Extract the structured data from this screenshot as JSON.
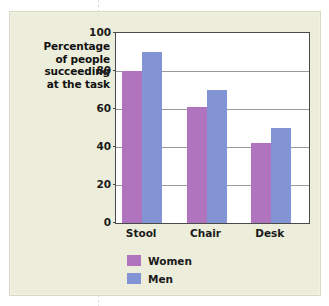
{
  "chart_data": {
    "type": "bar",
    "title": "",
    "xlabel": "",
    "ylabel": "Percentage of people succeeding at the task",
    "ylabel_lines": [
      "Percentage",
      "of people",
      "succeeding",
      "at the task"
    ],
    "categories": [
      "Stool",
      "Chair",
      "Desk"
    ],
    "series": [
      {
        "name": "Women",
        "color": "#b073bd",
        "values": [
          80,
          61,
          42
        ]
      },
      {
        "name": "Men",
        "color": "#8394d4",
        "values": [
          90,
          70,
          50
        ]
      }
    ],
    "ylim": [
      0,
      100
    ],
    "yticks": [
      0,
      20,
      40,
      60,
      80,
      100
    ],
    "ytick_labels": [
      "0",
      "20",
      "40",
      "60",
      "80",
      "100"
    ],
    "grid": true,
    "legend_position": "bottom-left"
  },
  "colors": {
    "background": "#eceedb",
    "plot_background": "#ffffff",
    "axis": "#4a4a4a",
    "gridline": "#9a9a9a",
    "women": "#b073bd",
    "men": "#8394d4"
  }
}
